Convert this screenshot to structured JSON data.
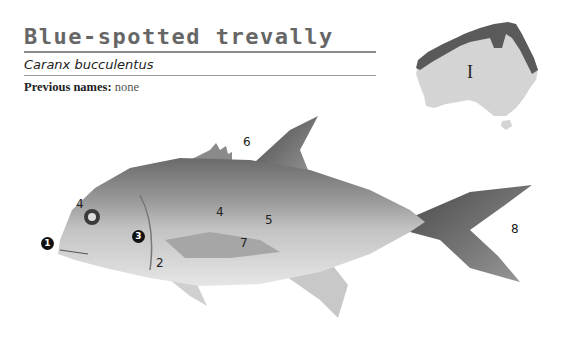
{
  "header": {
    "common_name": "Blue-spotted trevally",
    "scientific_name": "Caranx bucculentus",
    "previous_names_label": "Previous names:",
    "previous_names_value": "none"
  },
  "map": {
    "region_label": "I",
    "colors": {
      "land": "#d4d4d4",
      "range": "#5a5a5a"
    }
  },
  "fish_labels": {
    "l1": "1",
    "l2": "2",
    "l3": "3",
    "l4a": "4",
    "l4b": "4",
    "l5": "5",
    "l6": "6",
    "l7": "7",
    "l8": "8"
  }
}
